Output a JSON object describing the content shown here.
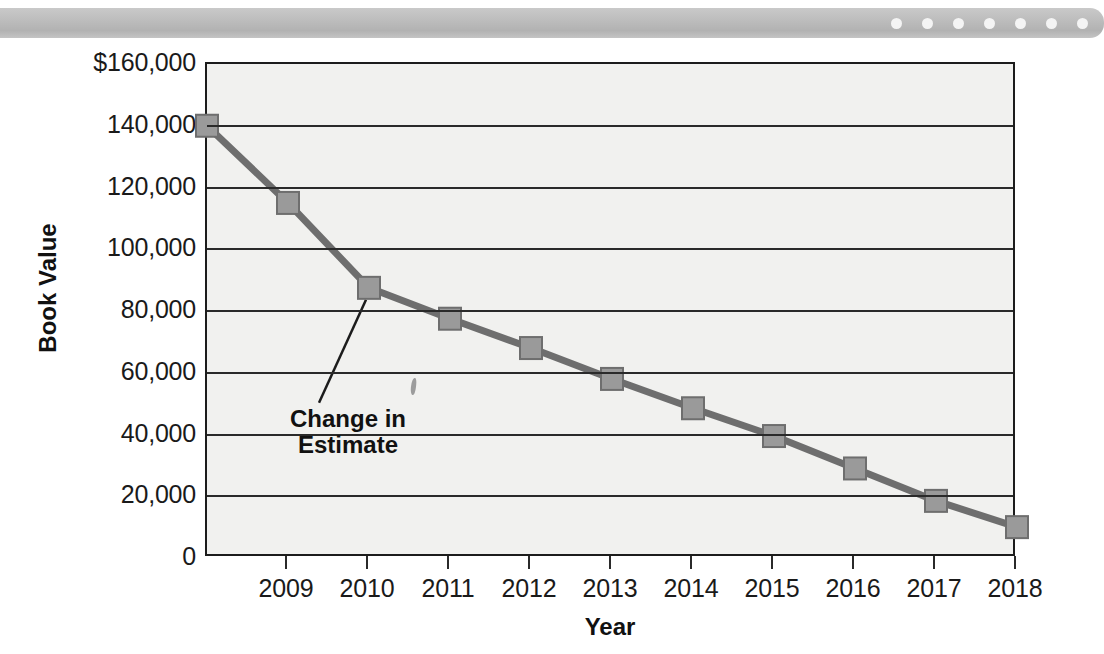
{
  "banner": {
    "dot_count": 7,
    "dot_color": "#f4f4f4",
    "bar_color": "#bdbdbd"
  },
  "chart_data": {
    "type": "line",
    "title": "",
    "xlabel": "Year",
    "ylabel": "Book Value",
    "grid": true,
    "legend": "none",
    "marker": "square",
    "line_color": "#6e6e6e",
    "marker_color": "#9a9a9a",
    "plot_background": "#f1f1ef",
    "ylim": [
      0,
      160000
    ],
    "ytick_labels": [
      "$160,000",
      "140,000",
      "120,000",
      "100,000",
      "80,000",
      "60,000",
      "40,000",
      "20,000",
      "0"
    ],
    "ytick_values": [
      160000,
      140000,
      120000,
      100000,
      80000,
      60000,
      40000,
      20000,
      0
    ],
    "xtick_labels": [
      "2009",
      "2010",
      "2011",
      "2012",
      "2013",
      "2014",
      "2015",
      "2016",
      "2017",
      "2018"
    ],
    "categories": [
      "2008",
      "2009",
      "2010",
      "2011",
      "2012",
      "2013",
      "2014",
      "2015",
      "2016",
      "2017",
      "2018"
    ],
    "values": [
      140000,
      115000,
      87500,
      77500,
      68000,
      58000,
      48500,
      39500,
      29000,
      18500,
      10000
    ],
    "annotations": [
      {
        "text_line1": "Change in",
        "text_line2": "Estimate",
        "points_to_category": "2010",
        "points_to_value": 87500
      }
    ]
  },
  "axis": {
    "x_title": "Year",
    "y_title": "Book Value"
  }
}
